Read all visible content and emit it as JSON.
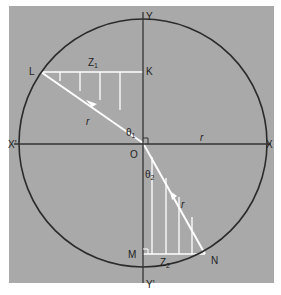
{
  "diagram": {
    "colors": {
      "background": "#a9a9a9",
      "page": "#ffffff",
      "circle": "#2b2b2b",
      "axes": "#333333",
      "highlight": "#ffffff",
      "text": "#1e1e1e"
    },
    "labels": {
      "Y": "Y",
      "Yprime": "Y'",
      "X": "X",
      "Xprime": "X'",
      "O": "O",
      "L": "L",
      "K": "K",
      "M": "M",
      "N": "N",
      "Z1": "Z",
      "Z1_sub": "1",
      "Z2": "Z",
      "Z2_sub": "2",
      "r_upper": "r",
      "r_lower": "r",
      "r_axis": "r",
      "theta1": "θ",
      "theta1_sub": "1",
      "theta2": "θ",
      "theta2_sub": "2"
    }
  }
}
